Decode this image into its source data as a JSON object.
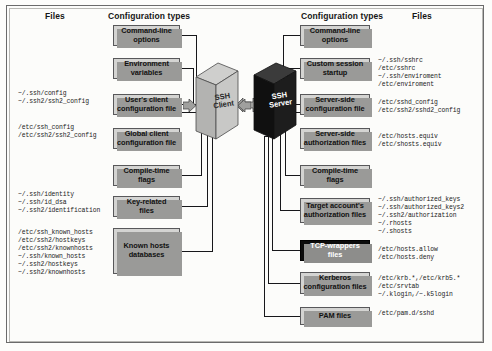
{
  "figure": {
    "headers": {
      "client_files": "Files",
      "client_config": "Configuration types",
      "server_config": "Configuration types",
      "server_files": "Files"
    },
    "nodes": {
      "client": {
        "label_line1": "SSH",
        "label_line2": "Client",
        "color": "#b9b9b7"
      },
      "server": {
        "label_line1": "SSH",
        "label_line2": "Server",
        "color": "#121212"
      }
    }
  },
  "client_side": {
    "config_types": [
      {
        "id": "command-line-options",
        "line1": "Command-line",
        "line2": "options",
        "style": "light"
      },
      {
        "id": "environment-variables",
        "line1": "Environment",
        "line2": "variables",
        "style": "light"
      },
      {
        "id": "users-client-configuration-file",
        "line1": "User's client",
        "line2": "configuration file",
        "style": "light"
      },
      {
        "id": "global-client-configuration-file",
        "line1": "Global client",
        "line2": "configuration file",
        "style": "light"
      },
      {
        "id": "compile-time-flags",
        "line1": "Compile-time",
        "line2": "flags",
        "style": "light"
      },
      {
        "id": "key-related-files",
        "line1": "Key-related",
        "line2": "files",
        "style": "light"
      },
      {
        "id": "known-hosts-databases",
        "line1": "Known hosts",
        "line2": "databases",
        "style": "light"
      }
    ],
    "file_groups": [
      {
        "id": "users-client-config-files",
        "lines": [
          "~/.ssh/config",
          "~/.ssh2/ssh2_config"
        ]
      },
      {
        "id": "global-client-config-files",
        "lines": [
          "/etc/ssh_config",
          "/etc/ssh2/ssh2_config"
        ]
      },
      {
        "id": "key-related-files-list",
        "lines": [
          "~/.ssh/identity",
          "~/.ssh/id_dsa",
          "~/.ssh2/identification"
        ]
      },
      {
        "id": "known-hosts-files-list",
        "lines": [
          "/etc/ssh_known_hosts",
          "/etc/ssh2/hostkeys",
          "/etc/ssh2/knownhosts",
          "~/.ssh/known_hosts",
          "~/.ssh2/hostkeys",
          "~/.ssh2/knownhosts"
        ]
      }
    ]
  },
  "server_side": {
    "config_types": [
      {
        "id": "command-line-options",
        "line1": "Command-line",
        "line2": "options",
        "style": "light"
      },
      {
        "id": "custom-session-startup",
        "line1": "Custom session",
        "line2": "startup",
        "style": "light"
      },
      {
        "id": "server-side-configuration-file",
        "line1": "Server-side",
        "line2": "configuration file",
        "style": "light"
      },
      {
        "id": "server-side-authorization-files",
        "line1": "Server-side",
        "line2": "authorization files",
        "style": "light"
      },
      {
        "id": "compile-time-flags",
        "line1": "Compile-time",
        "line2": "flags",
        "style": "light"
      },
      {
        "id": "target-accounts-authorization-files",
        "line1": "Target account's",
        "line2": "authorization files",
        "style": "light"
      },
      {
        "id": "tcp-wrappers-files",
        "line1": "TCP-wrappers",
        "line2": "files",
        "style": "dark"
      },
      {
        "id": "kerberos-configuration-files",
        "line1": "Kerberos",
        "line2": "configuration files",
        "style": "light"
      },
      {
        "id": "pam-files",
        "line1": "PAM files",
        "line2": "",
        "style": "light"
      }
    ],
    "file_groups": [
      {
        "id": "custom-session-startup-files",
        "lines": [
          "~/.ssh/sshrc",
          "/etc/sshrc",
          "~/.ssh/enviroment",
          "/etc/enviroment"
        ]
      },
      {
        "id": "server-side-config-files",
        "lines": [
          "/etc/sshd_config",
          "/etc/ssh2/sshd2_config"
        ]
      },
      {
        "id": "server-side-authorization-files-list",
        "lines": [
          "/etc/hosts.equiv",
          "/etc/shosts.equiv"
        ]
      },
      {
        "id": "target-account-authorization-files-list",
        "lines": [
          "~/.ssh/authorized_keys",
          "~/.ssh/authorized_keys2",
          "~/.ssh2/authorization",
          "~/.rhosts",
          "~/.shosts"
        ]
      },
      {
        "id": "tcp-wrappers-files-list",
        "lines": [
          "/etc/hosts.allow",
          "/etc/hosts.deny"
        ]
      },
      {
        "id": "kerberos-files-list",
        "lines": [
          "/etc/krb.*,/etc/krb5.*",
          "/etc/srvtab",
          "~/.klogin,/~.k5login"
        ]
      },
      {
        "id": "pam-files-list",
        "lines": [
          "/etc/pam.d/sshd"
        ]
      }
    ]
  }
}
